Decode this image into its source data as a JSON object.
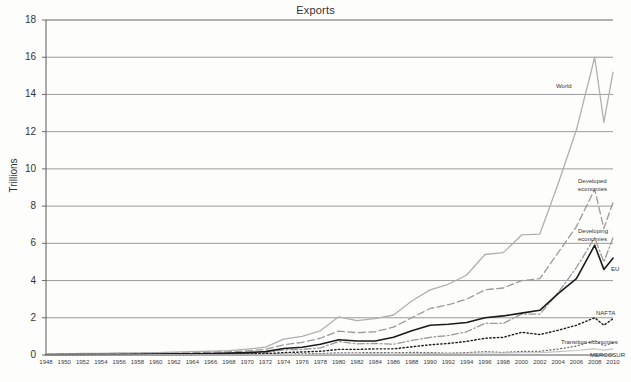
{
  "chart_data": {
    "type": "line",
    "title": "Exports",
    "xlabel": "",
    "ylabel": "Trillions",
    "ylim": [
      0,
      18
    ],
    "ytick_step": 2,
    "yticks": [
      0,
      2,
      4,
      6,
      8,
      10,
      12,
      14,
      16,
      18
    ],
    "xlim": [
      1948,
      2010
    ],
    "grid": "horizontal",
    "legend_position": "right-inline-labels",
    "x": [
      1948,
      1950,
      1952,
      1954,
      1956,
      1958,
      1960,
      1962,
      1964,
      1966,
      1968,
      1970,
      1972,
      1974,
      1976,
      1978,
      1980,
      1982,
      1984,
      1986,
      1988,
      1990,
      1992,
      1994,
      1996,
      1998,
      2000,
      2002,
      2004,
      2006,
      2008,
      2010
    ],
    "xticks": [
      "1948",
      "1950",
      "1952",
      "1954",
      "1956",
      "1958",
      "1960",
      "1962",
      "1964",
      "1966",
      "1968",
      "1970",
      "1972",
      "1974",
      "1976",
      "1978",
      "1980",
      "1982",
      "1984",
      "1986",
      "1988",
      "1990",
      "1992",
      "1994",
      "1996",
      "1998",
      "2000",
      "2002",
      "2004",
      "2006",
      "2008",
      "2010"
    ],
    "series": [
      {
        "name": "World",
        "label": "World",
        "color": "#b0b0b0",
        "style": "solid",
        "width": 1.3,
        "values": [
          0.06,
          0.06,
          0.08,
          0.09,
          0.11,
          0.11,
          0.13,
          0.15,
          0.18,
          0.21,
          0.24,
          0.32,
          0.42,
          0.85,
          1.0,
          1.3,
          2.05,
          1.85,
          1.95,
          2.15,
          2.9,
          3.5,
          3.8,
          4.3,
          5.4,
          5.5,
          6.45,
          6.5,
          9.2,
          12.1,
          16.0,
          15.2
        ],
        "dip_points": [
          {
            "x": 2009,
            "y": 12.5
          }
        ]
      },
      {
        "name": "Developed economies",
        "label": "Developed\neconomies",
        "color": "#9a9a9a",
        "style": "dashed",
        "width": 1.3,
        "values": [
          0.04,
          0.04,
          0.05,
          0.06,
          0.07,
          0.08,
          0.09,
          0.1,
          0.12,
          0.15,
          0.17,
          0.22,
          0.3,
          0.55,
          0.68,
          0.9,
          1.28,
          1.2,
          1.25,
          1.5,
          2.0,
          2.5,
          2.7,
          3.0,
          3.5,
          3.6,
          4.0,
          4.1,
          5.5,
          6.9,
          8.9,
          8.2
        ],
        "dip_points": [
          {
            "x": 2009,
            "y": 6.8
          }
        ]
      },
      {
        "name": "Developing economies",
        "label": "Developing\neconomies",
        "color": "#9a9a9a",
        "style": "dashdot",
        "width": 1.3,
        "values": [
          0.02,
          0.02,
          0.02,
          0.03,
          0.03,
          0.03,
          0.04,
          0.04,
          0.05,
          0.06,
          0.07,
          0.09,
          0.12,
          0.28,
          0.3,
          0.38,
          0.72,
          0.6,
          0.62,
          0.58,
          0.78,
          0.95,
          1.05,
          1.25,
          1.7,
          1.7,
          2.2,
          2.2,
          3.35,
          4.7,
          6.3,
          6.3
        ],
        "dip_points": [
          {
            "x": 2009,
            "y": 5.0
          }
        ]
      },
      {
        "name": "EU",
        "label": "EU",
        "color": "#1a1a1a",
        "style": "solid",
        "width": 1.6,
        "values": [
          0.01,
          0.02,
          0.02,
          0.03,
          0.03,
          0.04,
          0.05,
          0.06,
          0.07,
          0.08,
          0.1,
          0.13,
          0.18,
          0.35,
          0.42,
          0.58,
          0.82,
          0.75,
          0.75,
          0.95,
          1.3,
          1.6,
          1.65,
          1.75,
          2.0,
          2.1,
          2.25,
          2.4,
          3.3,
          4.1,
          5.9,
          5.2
        ],
        "dip_points": [
          {
            "x": 2009,
            "y": 4.6
          }
        ]
      },
      {
        "name": "NAFTA",
        "label": "NAFTA",
        "color": "#1a1a1a",
        "style": "dotted",
        "width": 1.4,
        "values": [
          0.01,
          0.01,
          0.02,
          0.02,
          0.02,
          0.02,
          0.03,
          0.03,
          0.03,
          0.04,
          0.05,
          0.06,
          0.07,
          0.13,
          0.16,
          0.2,
          0.3,
          0.3,
          0.33,
          0.33,
          0.44,
          0.55,
          0.62,
          0.73,
          0.9,
          0.95,
          1.22,
          1.1,
          1.33,
          1.6,
          2.0,
          1.95
        ],
        "dip_points": [
          {
            "x": 2009,
            "y": 1.6
          }
        ]
      },
      {
        "name": "Transition economies",
        "label": "Transition economies",
        "color": "#6d6d6d",
        "style": "dashdot-light",
        "width": 1.2,
        "values": [
          0.0,
          0.0,
          0.0,
          0.0,
          0.0,
          0.01,
          0.01,
          0.01,
          0.01,
          0.02,
          0.02,
          0.02,
          0.03,
          0.05,
          0.06,
          0.08,
          0.12,
          0.12,
          0.13,
          0.12,
          0.14,
          0.13,
          0.1,
          0.13,
          0.18,
          0.14,
          0.19,
          0.2,
          0.32,
          0.48,
          0.78,
          0.65
        ],
        "dip_points": [
          {
            "x": 2009,
            "y": 0.5
          }
        ]
      },
      {
        "name": "MERCOSUR",
        "label": "MERCOSUR",
        "color": "#c2c2c2",
        "style": "solid",
        "width": 1.1,
        "values": [
          0.0,
          0.0,
          0.0,
          0.0,
          0.0,
          0.0,
          0.01,
          0.01,
          0.01,
          0.01,
          0.01,
          0.01,
          0.02,
          0.03,
          0.03,
          0.04,
          0.05,
          0.05,
          0.06,
          0.05,
          0.07,
          0.08,
          0.08,
          0.09,
          0.11,
          0.11,
          0.12,
          0.12,
          0.18,
          0.24,
          0.34,
          0.33
        ],
        "dip_points": [
          {
            "x": 2009,
            "y": 0.26
          }
        ]
      }
    ],
    "annotations": [
      {
        "name": "World",
        "text": "World",
        "x": 556,
        "y": 83
      },
      {
        "name": "Developed economies",
        "text": "Developed\neconomies",
        "x": 578,
        "y": 178
      },
      {
        "name": "Developing economies",
        "text": "Developing\neconomies",
        "x": 578,
        "y": 228
      },
      {
        "name": "EU",
        "text": "EU",
        "x": 611,
        "y": 266
      },
      {
        "name": "NAFTA",
        "text": "NAFTA",
        "x": 596,
        "y": 310
      },
      {
        "name": "Transition economies",
        "text": "Transition economies",
        "x": 561,
        "y": 339
      },
      {
        "name": "MERCOSUR",
        "text": "MERCOSUR",
        "x": 590,
        "y": 352
      }
    ],
    "colors": {
      "gridline": "#8f8f8f",
      "axis": "#5a5a5a",
      "background": "#fdfdfc",
      "text": "#333333"
    }
  }
}
